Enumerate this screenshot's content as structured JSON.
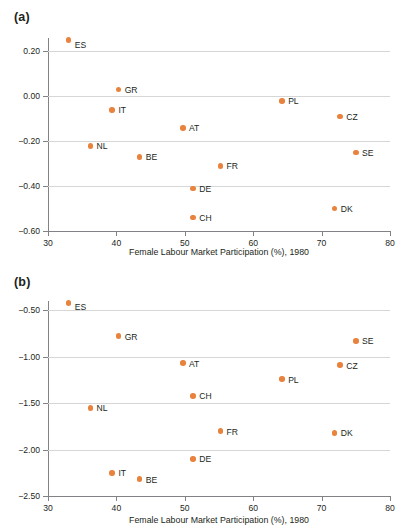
{
  "figure": {
    "panels": [
      {
        "tag": "(a)",
        "xlabel": "Female Labour Market Participation (%), 1980",
        "xticks": [
          "30",
          "40",
          "50",
          "60",
          "70",
          "80"
        ],
        "yticks": [
          "0.20",
          "0.00",
          "−0.20",
          "−0.40",
          "−0.60"
        ]
      },
      {
        "tag": "(b)",
        "xlabel": "Female Labour Market Participation (%), 1980",
        "xticks": [
          "30",
          "40",
          "50",
          "60",
          "70",
          "80"
        ],
        "yticks": [
          "−0.50",
          "−1.00",
          "−1.50",
          "−2.00",
          "−2.50"
        ]
      }
    ]
  },
  "chart_data": [
    {
      "type": "scatter",
      "title": "(a)",
      "xlabel": "Female Labour Market Participation (%), 1980",
      "ylabel": "",
      "xlim": [
        30,
        80
      ],
      "ylim": [
        -0.6,
        0.26
      ],
      "xticks": [
        30,
        40,
        50,
        60,
        70,
        80
      ],
      "yticks": [
        0.2,
        0.0,
        -0.2,
        -0.4,
        -0.6
      ],
      "grid": "horizontal",
      "legend": "none",
      "marker_color": "#e8823c",
      "points": [
        {
          "label": "ES",
          "x": 33.0,
          "y": 0.25
        },
        {
          "label": "GR",
          "x": 40.3,
          "y": 0.03
        },
        {
          "label": "IT",
          "x": 39.4,
          "y": -0.06
        },
        {
          "label": "PL",
          "x": 64.2,
          "y": -0.02
        },
        {
          "label": "CZ",
          "x": 72.7,
          "y": -0.09
        },
        {
          "label": "AT",
          "x": 49.7,
          "y": -0.14
        },
        {
          "label": "NL",
          "x": 36.2,
          "y": -0.22
        },
        {
          "label": "SE",
          "x": 75.0,
          "y": -0.25
        },
        {
          "label": "BE",
          "x": 43.4,
          "y": -0.27
        },
        {
          "label": "FR",
          "x": 55.2,
          "y": -0.31
        },
        {
          "label": "DE",
          "x": 51.2,
          "y": -0.41
        },
        {
          "label": "DK",
          "x": 71.9,
          "y": -0.5
        },
        {
          "label": "CH",
          "x": 51.2,
          "y": -0.54
        }
      ]
    },
    {
      "type": "scatter",
      "title": "(b)",
      "xlabel": "Female Labour Market Participation (%), 1980",
      "ylabel": "",
      "xlim": [
        30,
        80
      ],
      "ylim": [
        -2.5,
        -0.4
      ],
      "xticks": [
        30,
        40,
        50,
        60,
        70,
        80
      ],
      "yticks": [
        -0.5,
        -1.0,
        -1.5,
        -2.0,
        -2.5
      ],
      "grid": "horizontal",
      "legend": "none",
      "marker_color": "#e8823c",
      "points": [
        {
          "label": "ES",
          "x": 33.0,
          "y": -0.42
        },
        {
          "label": "GR",
          "x": 40.3,
          "y": -0.78
        },
        {
          "label": "SE",
          "x": 75.0,
          "y": -0.83
        },
        {
          "label": "AT",
          "x": 49.7,
          "y": -1.07
        },
        {
          "label": "CZ",
          "x": 72.7,
          "y": -1.09
        },
        {
          "label": "PL",
          "x": 64.2,
          "y": -1.24
        },
        {
          "label": "CH",
          "x": 51.2,
          "y": -1.42
        },
        {
          "label": "NL",
          "x": 36.2,
          "y": -1.55
        },
        {
          "label": "FR",
          "x": 55.2,
          "y": -1.8
        },
        {
          "label": "DK",
          "x": 71.9,
          "y": -1.82
        },
        {
          "label": "DE",
          "x": 51.2,
          "y": -2.1
        },
        {
          "label": "IT",
          "x": 39.4,
          "y": -2.25
        },
        {
          "label": "BE",
          "x": 43.4,
          "y": -2.32
        }
      ]
    }
  ]
}
